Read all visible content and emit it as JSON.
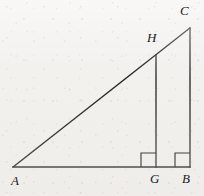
{
  "figure": {
    "background_color": "#f3f1ee",
    "stroke_color": "#201f1e",
    "labels": {
      "a": "A",
      "b": "B",
      "c": "C",
      "g": "G",
      "h": "H"
    },
    "points": {
      "A": {
        "x": 13,
        "y": 167
      },
      "B": {
        "x": 190,
        "y": 167
      },
      "C": {
        "x": 190,
        "y": 28
      },
      "G": {
        "x": 156,
        "y": 167
      },
      "H": {
        "x": 156,
        "y": 55
      }
    },
    "label_positions": {
      "A": {
        "x": 11,
        "y": 174
      },
      "B": {
        "x": 182,
        "y": 172
      },
      "C": {
        "x": 180,
        "y": 4
      },
      "G": {
        "x": 150,
        "y": 172
      },
      "H": {
        "x": 147,
        "y": 31
      }
    },
    "segments": [
      {
        "name": "base-AB",
        "from": "A",
        "to": "B"
      },
      {
        "name": "hypotenuse-AC",
        "from": "A",
        "to": "C"
      },
      {
        "name": "leg-CB",
        "from": "C",
        "to": "B"
      },
      {
        "name": "altitude-HG",
        "from": "H",
        "to": "G"
      }
    ],
    "right_angle_marks": [
      {
        "name": "right-angle-at-G",
        "x": 141,
        "y": 153,
        "size": 15
      },
      {
        "name": "right-angle-at-B",
        "x": 175,
        "y": 153,
        "size": 15
      }
    ]
  }
}
